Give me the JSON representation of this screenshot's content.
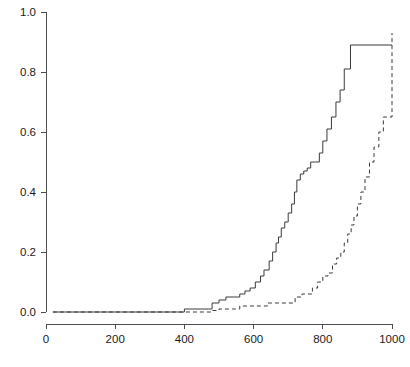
{
  "chart_data": {
    "type": "line",
    "title": "",
    "subtitle": "",
    "xlabel": "",
    "ylabel": "",
    "xlim": [
      0,
      1000
    ],
    "ylim": [
      0.0,
      1.0
    ],
    "grid": false,
    "legend": "none",
    "x_ticks": [
      0,
      200,
      400,
      600,
      800,
      1000
    ],
    "x_tick_labels": [
      "0",
      "200",
      "400",
      "600",
      "800",
      "1000"
    ],
    "y_ticks": [
      0.0,
      0.2,
      0.4,
      0.6,
      0.8,
      1.0
    ],
    "y_tick_labels": [
      "0.0",
      "0.2",
      "0.4",
      "0.6",
      "0.8",
      "1.0"
    ],
    "axis_color": "#4d4d4d",
    "series": [
      {
        "name": "solid-step-curve",
        "style": "solid",
        "color": "#3a3a3a",
        "interpolation": "step-post",
        "x": [
          20,
          380,
          400,
          470,
          480,
          500,
          520,
          545,
          560,
          575,
          590,
          605,
          620,
          630,
          645,
          655,
          665,
          672,
          680,
          690,
          700,
          710,
          718,
          725,
          735,
          745,
          755,
          765,
          775,
          790,
          800,
          812,
          825,
          838,
          850,
          862,
          880,
          1000
        ],
        "y": [
          0.0,
          0.0,
          0.01,
          0.01,
          0.03,
          0.04,
          0.05,
          0.05,
          0.06,
          0.07,
          0.08,
          0.1,
          0.12,
          0.14,
          0.17,
          0.2,
          0.23,
          0.25,
          0.28,
          0.3,
          0.33,
          0.36,
          0.4,
          0.44,
          0.46,
          0.47,
          0.48,
          0.5,
          0.5,
          0.53,
          0.57,
          0.61,
          0.65,
          0.7,
          0.74,
          0.81,
          0.89,
          0.89
        ]
      },
      {
        "name": "dashed-step-curve",
        "style": "dashed",
        "color": "#3a3a3a",
        "interpolation": "step-post",
        "x": [
          20,
          400,
          480,
          500,
          540,
          560,
          620,
          640,
          700,
          720,
          740,
          755,
          770,
          785,
          800,
          815,
          828,
          840,
          852,
          862,
          872,
          882,
          890,
          900,
          910,
          922,
          935,
          948,
          962,
          975,
          990,
          1000
        ],
        "y": [
          0.0,
          0.0,
          0.005,
          0.01,
          0.01,
          0.02,
          0.02,
          0.03,
          0.03,
          0.05,
          0.06,
          0.06,
          0.08,
          0.1,
          0.12,
          0.13,
          0.16,
          0.18,
          0.2,
          0.23,
          0.26,
          0.29,
          0.32,
          0.36,
          0.4,
          0.45,
          0.5,
          0.55,
          0.6,
          0.65,
          0.65,
          0.93
        ]
      }
    ]
  },
  "geometry": {
    "plot_left_px": 46,
    "plot_right_px": 392,
    "plot_top_px": 12,
    "plot_bottom_px": 312,
    "axis_x_y_px": 324,
    "tick_len_px": 5
  }
}
